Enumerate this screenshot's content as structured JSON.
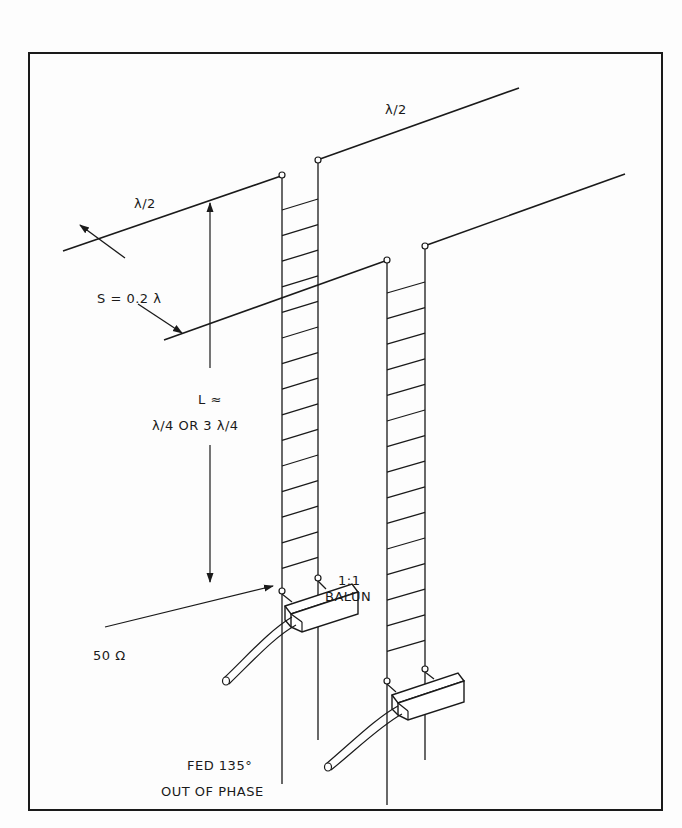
{
  "labels": {
    "top_dipole_length": "λ/2",
    "left_dipole_length": "λ/2",
    "spacing": "S = 0.2  λ",
    "feed_length_line1": "L ≈",
    "feed_length_line2": "λ/4  OR  3 λ/4",
    "balun_ratio": "1:1",
    "balun_label": "BALUN",
    "impedance": "50 Ω",
    "feed_note_line1": "FED 135°",
    "feed_note_line2": "OUT OF PHASE"
  },
  "colors": {
    "ink": "#1a1a1a",
    "paper": "#fdfdfd"
  }
}
